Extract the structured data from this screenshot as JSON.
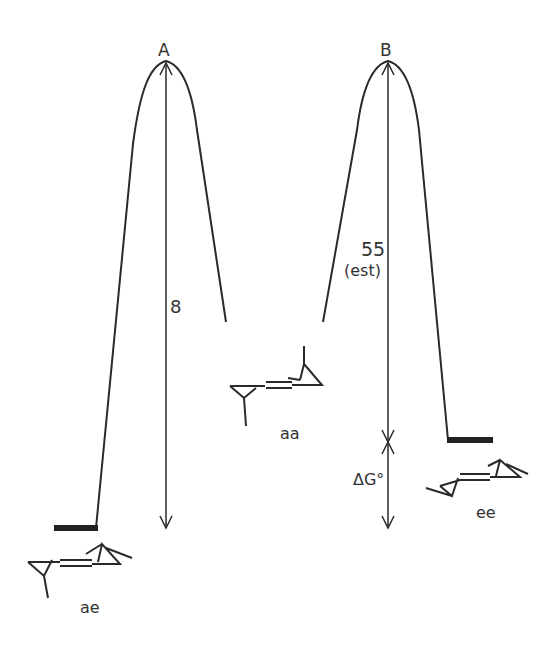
{
  "diagram": {
    "type": "energy-profile",
    "transition_states": [
      {
        "id": "A",
        "label": "A",
        "barrier_label": "8"
      },
      {
        "id": "B",
        "label": "B",
        "barrier_label": "55",
        "barrier_note": "(est)"
      }
    ],
    "conformers": [
      {
        "id": "ae",
        "label": "ae"
      },
      {
        "id": "aa",
        "label": "aa"
      },
      {
        "id": "ee",
        "label": "ee"
      }
    ],
    "free_energy_label": "ΔG°",
    "atom_label": "N",
    "colors": {
      "line": "#2a2a2a",
      "background": "#ffffff"
    }
  }
}
